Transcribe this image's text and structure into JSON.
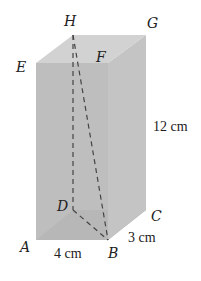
{
  "figure": {
    "type": "rectangular prism",
    "vertices": {
      "H": "H",
      "G": "G",
      "E": "E",
      "F": "F",
      "D": "D",
      "C": "C",
      "A": "A",
      "B": "B"
    },
    "dimensions": {
      "length": "4 cm",
      "width": "3 cm",
      "height": "12 cm"
    },
    "diagonal": "HB",
    "colors": {
      "front": "#b9b9b9",
      "top": "#d2d2d2",
      "right": "#c4c4c4",
      "bottom": "#a9a9a9",
      "dashed": "#444444"
    }
  }
}
